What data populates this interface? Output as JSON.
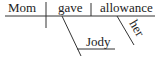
{
  "diagram": {
    "type": "sentence-diagram",
    "sentence": "Mom gave Jody her allowance",
    "subject": "Mom",
    "verb": "gave",
    "direct_object": "allowance",
    "indirect_object": "Jody",
    "modifier_of_direct_object": "her",
    "ink_color": "#333333"
  }
}
